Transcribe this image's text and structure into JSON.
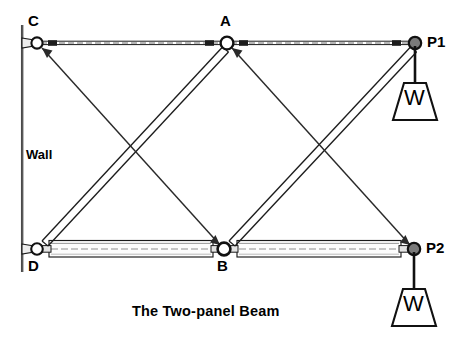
{
  "figure": {
    "title": "The Two-panel Beam",
    "wall_label": "Wall",
    "background_color": "#ffffff",
    "ink_color": "#000000",
    "joint_fill": "#7a7a7a"
  },
  "joints": [
    {
      "id": "C",
      "label": "C",
      "x": 37,
      "y": 43,
      "label_x": 28,
      "label_y": 14,
      "kind": "pin-on-wall"
    },
    {
      "id": "A",
      "label": "A",
      "x": 227,
      "y": 43,
      "label_x": 219,
      "label_y": 14,
      "kind": "pin"
    },
    {
      "id": "P1",
      "label": "P1",
      "x": 415,
      "y": 43,
      "label_x": 426,
      "label_y": 33,
      "kind": "loaded-node"
    },
    {
      "id": "D",
      "label": "D",
      "x": 37,
      "y": 249,
      "label_x": 28,
      "label_y": 258,
      "kind": "pin-on-wall"
    },
    {
      "id": "B",
      "label": "B",
      "x": 224,
      "y": 249,
      "label_x": 217,
      "label_y": 258,
      "kind": "pin"
    },
    {
      "id": "P2",
      "label": "P2",
      "x": 414,
      "y": 249,
      "label_x": 425,
      "label_y": 239,
      "kind": "loaded-node"
    }
  ],
  "members": [
    {
      "name": "top-chord-C-A",
      "from": "C",
      "to": "A",
      "style": "thin-tie"
    },
    {
      "name": "top-chord-A-P1",
      "from": "A",
      "to": "P1",
      "style": "thin-tie"
    },
    {
      "name": "bottom-chord-D-B",
      "from": "D",
      "to": "B",
      "style": "thick-tube"
    },
    {
      "name": "bottom-chord-B-P2",
      "from": "B",
      "to": "P2",
      "style": "thick-tube"
    },
    {
      "name": "diagonal-strut-D-A",
      "from": "D",
      "to": "A",
      "style": "double-strut"
    },
    {
      "name": "diagonal-strut-B-P1",
      "from": "B",
      "to": "P1",
      "style": "double-strut"
    },
    {
      "name": "diagonal-tie-C-B",
      "from": "C",
      "to": "B",
      "style": "single-tie"
    },
    {
      "name": "diagonal-tie-A-P2",
      "from": "A",
      "to": "P2",
      "style": "single-tie"
    }
  ],
  "loads": [
    {
      "name": "load-P1",
      "at": "P1",
      "label": "W",
      "hanger_x": 415,
      "hanger_top": 43,
      "hanger_bottom": 82,
      "weight_top_y": 82,
      "weight_bottom_y": 120
    },
    {
      "name": "load-P2",
      "at": "P2",
      "label": "W",
      "hanger_x": 414,
      "hanger_top": 249,
      "hanger_bottom": 288,
      "weight_top_y": 288,
      "weight_bottom_y": 326
    }
  ],
  "wall": {
    "x": 22,
    "y_top": 25,
    "y_bottom": 272
  },
  "labels": {
    "wall": "Wall",
    "wall_x": 26,
    "wall_y": 148,
    "title": "The Two-panel Beam",
    "title_x": 132,
    "title_y": 311
  }
}
